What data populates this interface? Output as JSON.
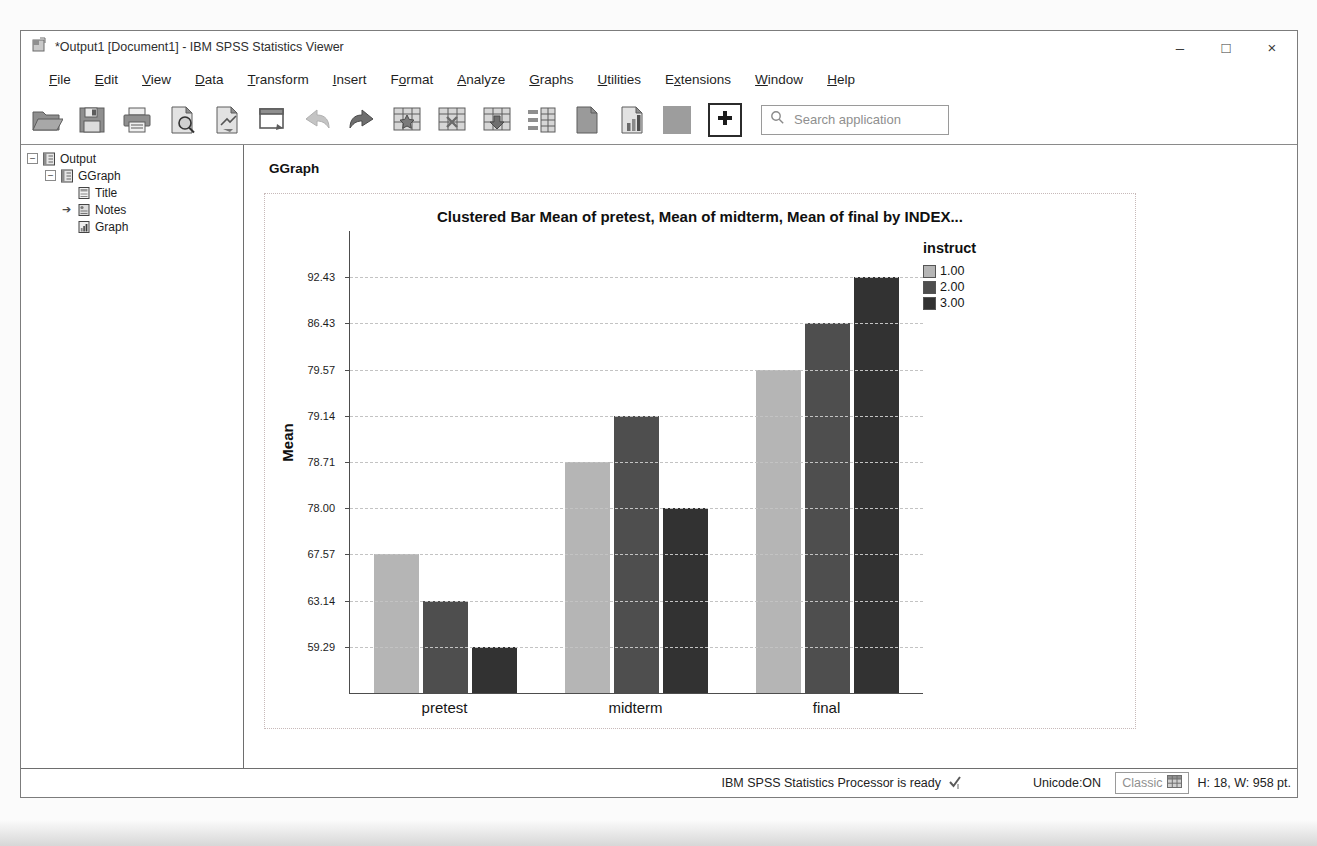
{
  "window": {
    "title": "*Output1 [Document1] - IBM SPSS Statistics Viewer",
    "controls": {
      "minimize": "–",
      "maximize": "□",
      "close": "×"
    }
  },
  "menu_bar": {
    "items": [
      {
        "label": "File",
        "u": 0
      },
      {
        "label": "Edit",
        "u": 0
      },
      {
        "label": "View",
        "u": 0
      },
      {
        "label": "Data",
        "u": 0
      },
      {
        "label": "Transform",
        "u": 0
      },
      {
        "label": "Insert",
        "u": 0
      },
      {
        "label": "Format",
        "u": 1
      },
      {
        "label": "Analyze",
        "u": 0
      },
      {
        "label": "Graphs",
        "u": 0
      },
      {
        "label": "Utilities",
        "u": 0
      },
      {
        "label": "Extensions",
        "u": 1
      },
      {
        "label": "Window",
        "u": 0
      },
      {
        "label": "Help",
        "u": 0
      }
    ]
  },
  "toolbar": {
    "buttons": [
      {
        "icon": "open-icon"
      },
      {
        "icon": "save-icon"
      },
      {
        "icon": "print-icon"
      },
      {
        "icon": "print-preview-icon"
      },
      {
        "icon": "export-icon"
      },
      {
        "icon": "recall-dialogs-icon"
      },
      {
        "icon": "undo-icon"
      },
      {
        "icon": "redo-icon"
      },
      {
        "icon": "goto-case-icon"
      },
      {
        "icon": "goto-variable-icon"
      },
      {
        "icon": "variables-icon"
      },
      {
        "icon": "use-sets-icon"
      },
      {
        "icon": "document-icon"
      },
      {
        "icon": "chart-document-icon"
      },
      {
        "icon": "swatch-icon"
      }
    ],
    "add_button_icon": "plus-icon",
    "search_placeholder": "Search application"
  },
  "tree": {
    "items": [
      {
        "label": "Output",
        "level": 0,
        "expander": "minus",
        "icon": "output-book-icon"
      },
      {
        "label": "GGraph",
        "level": 1,
        "expander": "minus",
        "icon": "ggraph-book-icon"
      },
      {
        "label": "Title",
        "level": 2,
        "expander": null,
        "icon": "title-page-icon"
      },
      {
        "label": "Notes",
        "level": 2,
        "expander": null,
        "icon": "notes-page-icon",
        "arrow": true
      },
      {
        "label": "Graph",
        "level": 2,
        "expander": null,
        "icon": "graph-page-icon"
      }
    ]
  },
  "content": {
    "heading": "GGraph"
  },
  "chart_data": {
    "type": "bar",
    "title": "Clustered Bar Mean of pretest, Mean of midterm, Mean of final by INDEX...",
    "xlabel": "",
    "ylabel": "Mean",
    "legend_title": "instruct",
    "legend_position": "top-right",
    "grid": "dashed-horizontal",
    "categories": [
      "pretest",
      "midterm",
      "final"
    ],
    "series": [
      {
        "name": "1.00",
        "color": "#b5b5b5",
        "values": [
          67.57,
          78.71,
          79.57
        ]
      },
      {
        "name": "2.00",
        "color": "#4e4e4e",
        "values": [
          63.14,
          79.14,
          86.43
        ]
      },
      {
        "name": "3.00",
        "color": "#323232",
        "values": [
          59.29,
          78.0,
          92.43
        ]
      }
    ],
    "y_ticks_bottom_to_top": [
      59.29,
      63.14,
      67.57,
      78.0,
      78.71,
      79.14,
      79.57,
      86.43,
      92.43
    ],
    "y_tick_labels_bottom_to_top": [
      "59.29",
      "63.14",
      "67.57",
      "78.00",
      "78.71",
      "79.14",
      "79.57",
      "86.43",
      "92.43"
    ]
  },
  "status_bar": {
    "processor": "IBM SPSS Statistics Processor is ready",
    "unicode": "Unicode:ON",
    "style_selector": "Classic",
    "dimensions": "H: 18, W: 958 pt."
  }
}
